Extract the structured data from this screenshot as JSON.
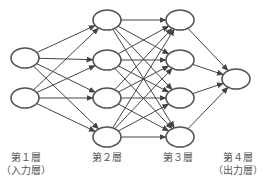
{
  "diagram": {
    "type": "neural-network",
    "node_stroke": "#555555",
    "edge_stroke": "#444444",
    "node_rx": 14,
    "node_ry": 10,
    "layers": [
      {
        "name": "第１層",
        "role": "（入力層）",
        "x": 25,
        "nodes_y": [
          58,
          98
        ],
        "label_x": 26
      },
      {
        "name": "第２層",
        "role": "",
        "x": 107,
        "nodes_y": [
          20,
          60,
          98,
          137
        ],
        "label_x": 107
      },
      {
        "name": "第３層",
        "role": "",
        "x": 180,
        "nodes_y": [
          20,
          60,
          98,
          137
        ],
        "label_x": 178
      },
      {
        "name": "第４層",
        "role": "（出力層）",
        "x": 236,
        "nodes_y": [
          79
        ],
        "label_x": 238
      }
    ]
  },
  "labels": {
    "layer1": "第１層",
    "layer1_role": "（入力層）",
    "layer2": "第２層",
    "layer3": "第３層",
    "layer4": "第４層",
    "layer4_role": "（出力層）"
  }
}
